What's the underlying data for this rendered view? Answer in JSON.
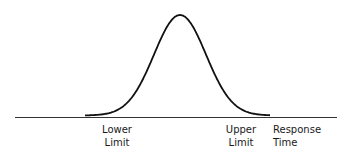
{
  "chart_data": {
    "type": "line",
    "title": "",
    "xlabel": "Response Time",
    "ylabel": "",
    "annotations": [
      {
        "label": "Lower Limit",
        "position": "left tail"
      },
      {
        "label": "Upper Limit",
        "position": "right tail"
      }
    ],
    "grid": false,
    "legend": "none"
  },
  "labels": {
    "lower_line1": "Lower",
    "lower_line2": "Limit",
    "upper_line1": "Upper",
    "upper_line2": "Limit",
    "axis": "Response Time"
  },
  "colors": {
    "curve": "#111111",
    "axis": "#333333"
  }
}
